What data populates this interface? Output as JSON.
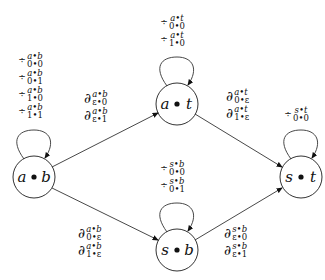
{
  "diagram": {
    "nodes": [
      {
        "id": "ab",
        "left": "a",
        "right": "b",
        "cx": 34,
        "cy": 177
      },
      {
        "id": "at",
        "left": "a",
        "right": "t",
        "cx": 177,
        "cy": 104
      },
      {
        "id": "sb",
        "left": "s",
        "right": "b",
        "cx": 177,
        "cy": 250
      },
      {
        "id": "st",
        "left": "s",
        "right": "t",
        "cx": 301,
        "cy": 177
      }
    ],
    "edges": [
      {
        "from": "ab",
        "to": "at"
      },
      {
        "from": "ab",
        "to": "sb"
      },
      {
        "from": "at",
        "to": "st"
      },
      {
        "from": "sb",
        "to": "st"
      }
    ],
    "self_loops": {
      "ab": {
        "op": "÷",
        "labels": [
          {
            "sup": "a•b",
            "sub": "0•0"
          },
          {
            "sup": "a•b",
            "sub": "0•1"
          },
          {
            "sup": "a•b",
            "sub": "1•0"
          },
          {
            "sup": "a•b",
            "sub": "1•1"
          }
        ]
      },
      "at": {
        "op": "÷",
        "labels": [
          {
            "sup": "a•t",
            "sub": "0•0"
          },
          {
            "sup": "a•t",
            "sub": "1•0"
          }
        ]
      },
      "sb": {
        "op": "÷",
        "labels": [
          {
            "sup": "s•b",
            "sub": "0•0"
          },
          {
            "sup": "s•b",
            "sub": "0•1"
          }
        ]
      },
      "st": {
        "op": "÷",
        "labels": [
          {
            "sup": "s•t",
            "sub": "0•0"
          }
        ]
      }
    },
    "edge_labels": {
      "ab_at": {
        "op": "∂",
        "labels": [
          {
            "sup": "a•b",
            "sub": "ε•0"
          },
          {
            "sup": "a•b",
            "sub": "ε•1"
          }
        ]
      },
      "at_st": {
        "op": "∂",
        "labels": [
          {
            "sup": "a•t",
            "sub": "0•ε"
          },
          {
            "sup": "a•t",
            "sub": "1•ε"
          }
        ]
      },
      "ab_sb": {
        "op": "∂",
        "labels": [
          {
            "sup": "a•b",
            "sub": "0•ε"
          },
          {
            "sup": "a•b",
            "sub": "1•ε"
          }
        ]
      },
      "sb_st": {
        "op": "∂",
        "labels": [
          {
            "sup": "s•b",
            "sub": "ε•0"
          },
          {
            "sup": "s•b",
            "sub": "ε•1"
          }
        ]
      }
    },
    "node_dot": "•"
  }
}
